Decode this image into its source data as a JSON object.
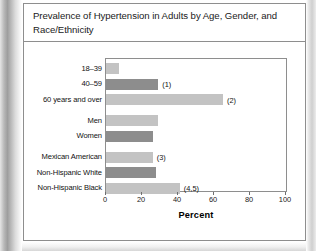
{
  "figure": {
    "title": "Prevalence of Hypertension in Adults by Age, Gender, and Race/Ethnicity"
  },
  "chart_data": {
    "type": "bar",
    "orientation": "horizontal",
    "title": "Prevalence of Hypertension in Adults by Age, Gender, and Race/Ethnicity",
    "xlabel": "Percent",
    "ylabel": "",
    "xlim": [
      0,
      100
    ],
    "xticks": [
      0,
      20,
      40,
      60,
      80,
      100
    ],
    "xtick_labels": [
      "0",
      "20",
      "40",
      "60",
      "80",
      "100"
    ],
    "grid": false,
    "legend": "none",
    "categories": [
      "18–39",
      "40–59",
      "60 years and over",
      "Men",
      "Women",
      "Mexican American",
      "Non-Hispanic White",
      "Non-Hispanic Black"
    ],
    "values": [
      7,
      29,
      65,
      29,
      26,
      26,
      28,
      41
    ],
    "annotations": [
      "",
      "(1)",
      "(2)",
      "",
      "",
      "(3)",
      "",
      "(4,5)"
    ],
    "bar_colors": [
      "#c3c3c3",
      "#8d8d8d",
      "#c3c3c3",
      "#c3c3c3",
      "#8d8d8d",
      "#c3c3c3",
      "#8d8d8d",
      "#c3c3c3"
    ],
    "groups": [
      {
        "name": "Age",
        "category_indices": [
          0,
          1,
          2
        ]
      },
      {
        "name": "Gender",
        "category_indices": [
          3,
          4
        ]
      },
      {
        "name": "Race/Ethnicity",
        "category_indices": [
          5,
          6,
          7
        ]
      }
    ]
  }
}
